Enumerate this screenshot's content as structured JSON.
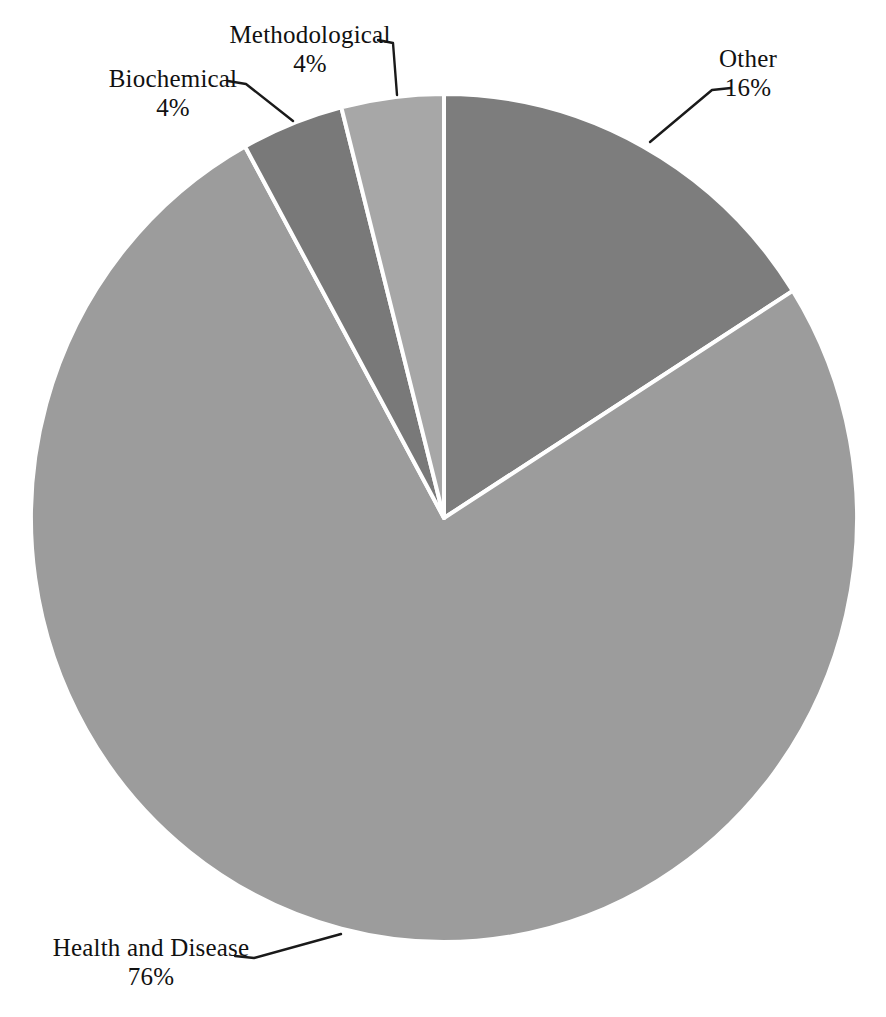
{
  "page": {
    "background_color": "#ffffff"
  },
  "chart_data": {
    "type": "pie",
    "title": "",
    "legend": "none",
    "labels_style": "external labels with leader lines",
    "start_angle": "12 o'clock, clockwise",
    "separator_color": "#ffffff",
    "leader_line_color": "#1a1a1a",
    "label_text_color": "#111111",
    "slices": [
      {
        "name": "Other",
        "value": 16,
        "pct_label": "16%",
        "color": "#7d7d7d"
      },
      {
        "name": "Health and Disease",
        "value": 76,
        "pct_label": "76%",
        "color": "#9c9c9c"
      },
      {
        "name": "Biochemical",
        "value": 4,
        "pct_label": "4%",
        "color": "#797979"
      },
      {
        "name": "Methodological",
        "value": 4,
        "pct_label": "4%",
        "color": "#a7a7a7"
      }
    ]
  }
}
